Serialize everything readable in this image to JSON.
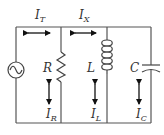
{
  "diagram": {
    "colors": {
      "wire": "#555555",
      "arrow": "#111111",
      "text": "#333333",
      "background": "#ffffff"
    },
    "source": {
      "label": "",
      "icon": "ac-source-icon"
    },
    "components": [
      {
        "id": "R",
        "label": "R",
        "type": "resistor"
      },
      {
        "id": "L",
        "label": "L",
        "type": "inductor"
      },
      {
        "id": "C",
        "label": "C",
        "type": "capacitor"
      }
    ],
    "currents": {
      "total": {
        "main": "I",
        "sub": "T"
      },
      "x": {
        "main": "I",
        "sub": "X"
      },
      "resistor": {
        "main": "I",
        "sub": "R"
      },
      "inductor": {
        "main": "I",
        "sub": "L"
      },
      "capacitor": {
        "main": "I",
        "sub": "C"
      }
    }
  }
}
